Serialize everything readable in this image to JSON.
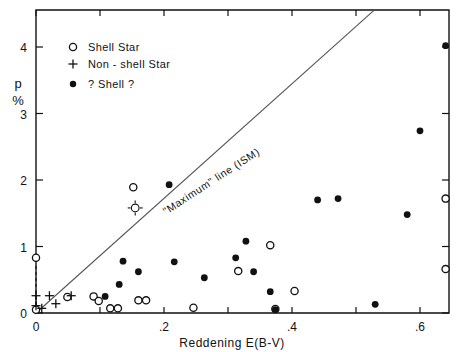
{
  "chart_data": {
    "type": "scatter",
    "title": "",
    "xlabel": "Reddening  E(B-V)",
    "ylabel_line1": "p",
    "ylabel_line2": "%",
    "xlim": [
      0.0,
      0.645
    ],
    "ylim": [
      0.0,
      4.55
    ],
    "xticks": [
      0.0,
      0.1,
      0.2,
      0.3,
      0.4,
      0.5,
      0.6
    ],
    "xticklabels": [
      "0",
      "",
      ".2",
      "",
      ".4",
      "",
      ".6"
    ],
    "yticks": [
      0,
      1,
      2,
      3,
      4
    ],
    "yticklabels": [
      "0",
      "1",
      "2",
      "3",
      "4"
    ],
    "grid": false,
    "legend_position": "upper-left",
    "legend": [
      {
        "marker": "open-circle",
        "label": "Shell  Star"
      },
      {
        "marker": "plus",
        "label": "Non - shell  Star"
      },
      {
        "marker": "filled-circle",
        "label": "? Shell ?"
      }
    ],
    "annotations": [
      {
        "text": "\"Maximum\"  line  (ISM)",
        "x": 0.2,
        "y": 2.55,
        "rotation": -33
      }
    ],
    "reference_line": {
      "name": "maximum-line-ism",
      "x0": 0.0,
      "y0": 0.0,
      "x1": 0.528,
      "y1": 4.55,
      "slope": 8.62
    },
    "series": [
      {
        "name": "Shell Star",
        "marker": "open-circle",
        "points": [
          [
            0.0,
            0.83
          ],
          [
            0.0,
            0.05
          ],
          [
            0.049,
            0.24
          ],
          [
            0.09,
            0.25
          ],
          [
            0.098,
            0.18
          ],
          [
            0.116,
            0.07
          ],
          [
            0.128,
            0.07
          ],
          [
            0.152,
            1.89
          ],
          [
            0.16,
            0.19
          ],
          [
            0.172,
            0.19
          ],
          [
            0.246,
            0.08
          ],
          [
            0.316,
            0.63
          ],
          [
            0.366,
            1.02
          ],
          [
            0.374,
            0.06
          ],
          [
            0.404,
            0.33
          ],
          [
            0.64,
            1.72
          ],
          [
            0.64,
            0.66
          ]
        ]
      },
      {
        "name": "Non-shell Star",
        "marker": "plus",
        "points": [
          [
            0.0,
            0.11
          ],
          [
            0.0,
            0.26
          ],
          [
            0.009,
            0.07
          ],
          [
            0.021,
            0.26
          ],
          [
            0.031,
            0.14
          ],
          [
            0.055,
            0.26
          ]
        ]
      },
      {
        "name": "? Shell ?",
        "marker": "filled-circle",
        "points": [
          [
            0.108,
            0.25
          ],
          [
            0.13,
            0.43
          ],
          [
            0.136,
            0.78
          ],
          [
            0.16,
            0.62
          ],
          [
            0.208,
            1.93
          ],
          [
            0.216,
            0.77
          ],
          [
            0.263,
            0.53
          ],
          [
            0.312,
            0.83
          ],
          [
            0.328,
            1.08
          ],
          [
            0.34,
            0.62
          ],
          [
            0.366,
            0.32
          ],
          [
            0.374,
            0.05
          ],
          [
            0.44,
            1.7
          ],
          [
            0.472,
            1.72
          ],
          [
            0.53,
            0.13
          ],
          [
            0.58,
            1.48
          ],
          [
            0.6,
            2.74
          ],
          [
            0.64,
            4.02
          ]
        ]
      },
      {
        "name": "circled-plus marker",
        "marker": "circle-with-ticks",
        "points": [
          [
            0.155,
            1.58
          ]
        ]
      }
    ]
  },
  "axes": {
    "x_title": "Reddening  E(B-V)",
    "y_title_top": "p",
    "y_title_bottom": "%"
  }
}
